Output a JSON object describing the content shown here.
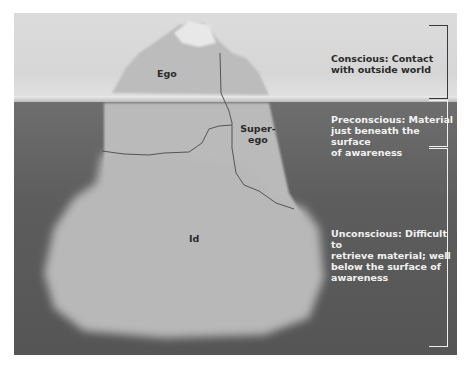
{
  "diagram": {
    "type": "iceberg",
    "structures": {
      "ego": "Ego",
      "superego": "Super-\nego",
      "superego_line1": "Super-",
      "superego_line2": "ego",
      "id": "Id"
    },
    "levels": [
      {
        "name": "conscious",
        "text": "Conscious: Contact with outside world",
        "line1": "Conscious: Contact",
        "line2": "with outside world"
      },
      {
        "name": "preconscious",
        "text": "Preconscious: Material just beneath the surface of awareness",
        "line1": "Preconscious: Material",
        "line2": "just beneath the surface",
        "line3": "of awareness"
      },
      {
        "name": "unconscious",
        "text": "Unconscious: Difficult to retrieve material; well below the surface of awareness",
        "line1": "Unconscious: Difficult to",
        "line2": "retrieve material; well",
        "line3": "below the surface of",
        "line4": "awareness"
      }
    ],
    "colors": {
      "sky": "#d8d8d8",
      "water": "#5e5e5e",
      "iceberg": "#bdbdbd",
      "bracket_conscious": "#3a3a3a",
      "bracket_lower": "#f0f0f0"
    }
  }
}
